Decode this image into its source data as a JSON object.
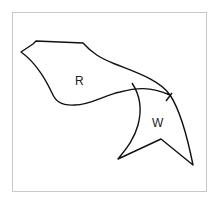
{
  "diagram": {
    "regions": [
      {
        "id": "R",
        "label": "R"
      },
      {
        "id": "W",
        "label": "W"
      }
    ],
    "colors": {
      "frame": "#c8c8c8",
      "stroke": "#111111",
      "label": "#222222",
      "background": "#ffffff"
    }
  }
}
